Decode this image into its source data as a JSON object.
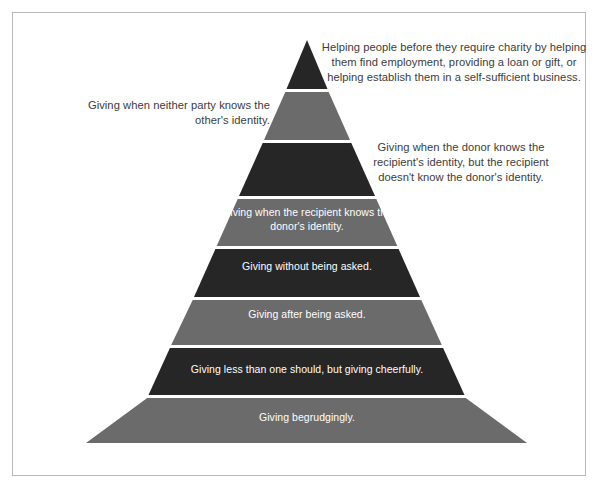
{
  "diagram": {
    "colors": {
      "dark_band": "#262626",
      "light_band": "#6b6b6b",
      "separator": "#ffffff",
      "frame_border": "#b9b9b9",
      "background": "#ffffff",
      "label_text": "#ffffff",
      "callout_text": "#3c3c3c"
    },
    "tiers": [
      {
        "index": 1,
        "shade": "dark",
        "placement": "callout-right",
        "text": "Helping people before they require charity by helping them find employment, providing a loan or gift, or helping establish them in a self-sufficient business."
      },
      {
        "index": 2,
        "shade": "light",
        "placement": "callout-left",
        "text": "Giving when neither party knows the other's identity."
      },
      {
        "index": 3,
        "shade": "dark",
        "placement": "callout-right",
        "text": "Giving when the donor knows the recipient's identity, but the recipient doesn't know the donor's identity."
      },
      {
        "index": 4,
        "shade": "light",
        "placement": "inside",
        "text": "Giving when the recipient knows the donor's identity."
      },
      {
        "index": 5,
        "shade": "dark",
        "placement": "inside",
        "text": "Giving without being asked."
      },
      {
        "index": 6,
        "shade": "light",
        "placement": "inside",
        "text": "Giving after being asked."
      },
      {
        "index": 7,
        "shade": "dark",
        "placement": "inside",
        "text": "Giving less than one should, but giving cheerfully."
      },
      {
        "index": 8,
        "shade": "light",
        "placement": "inside",
        "text": "Giving begrudgingly."
      }
    ],
    "callout_lines": {
      "tier1": [
        "Helping people before they require charity by helping",
        "them find employment, providing a loan or gift, or",
        "helping establish them in a self-sufficient business."
      ],
      "tier2": [
        "Giving when neither party knows the",
        "other's identity."
      ],
      "tier3": [
        "Giving when the donor knows the",
        "recipient's identity, but the recipient",
        "doesn't know the donor's identity."
      ],
      "tier4": [
        "Giving when the recipient knows the",
        "donor's identity."
      ]
    }
  }
}
